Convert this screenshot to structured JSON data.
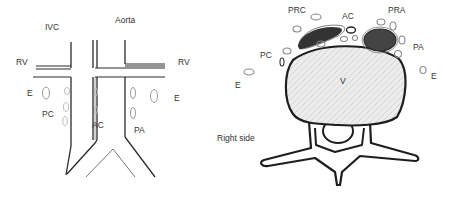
{
  "left_panel": {
    "view": "anterior",
    "labels": {
      "ivc": "IVC",
      "aorta": "Aorta",
      "rv_left": "RV",
      "rv_right": "RV",
      "e_left": "E",
      "e_right": "E",
      "pc": "PC",
      "ac": "AC",
      "pa": "PA"
    }
  },
  "right_panel": {
    "view": "axial",
    "labels": {
      "prc": "PRC",
      "ac": "AC",
      "pra": "PRA",
      "pc": "PC",
      "pa": "PA",
      "e_left": "E",
      "e_right": "E",
      "v": "V",
      "right_side": "Right side"
    }
  },
  "colors": {
    "line": "#2a2a2a",
    "node_outline": "#8a8a8a",
    "dark_fill": "#3a3a3a",
    "vertebra_fill": "#e6e6e6"
  }
}
